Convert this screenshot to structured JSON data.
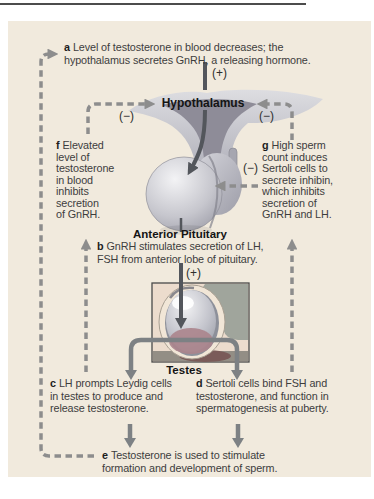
{
  "figure": {
    "title_labels": {
      "hypothalamus": "Hypothalamus",
      "anterior_pituitary": "Anterior Pituitary",
      "testes": "Testes"
    },
    "signs": {
      "plus": "(+)",
      "minus": "(−)"
    },
    "notes": {
      "a": {
        "letter": "a",
        "lines": [
          "Level of testosterone in blood decreases; the",
          "hypothalamus secretes GnRH, a releasing hormone."
        ]
      },
      "b": {
        "letter": "b",
        "lines": [
          "GnRH stimulates secretion of LH,",
          "FSH from anterior lobe of pituitary."
        ]
      },
      "c": {
        "letter": "c",
        "lines": [
          "LH prompts Leydig cells",
          "in testes to produce and",
          "release testosterone."
        ]
      },
      "d": {
        "letter": "d",
        "lines": [
          "Sertoli cells bind FSH and",
          "testosterone, and function in",
          "spermatogenesis at puberty."
        ]
      },
      "e": {
        "letter": "e",
        "lines": [
          "Testosterone is used to stimulate",
          "formation and development of sperm."
        ]
      },
      "f": {
        "letter": "f",
        "lines": [
          "Elevated",
          "level of",
          "testosterone",
          "in blood",
          "inhibits",
          "secretion",
          "of GnRH."
        ]
      },
      "g": {
        "letter": "g",
        "lines": [
          "High sperm",
          "count induces",
          "Sertoli cells to",
          "secrete inhibin,",
          "which inhibits",
          "secretion of",
          "GnRH and LH."
        ]
      }
    },
    "colors": {
      "panel_bg": "#f1eadd",
      "dashed_line": "#8d8d8d",
      "solid_line": "#7d8184",
      "stimulus_arrow": "#53565c",
      "text": "#3d3d3d"
    }
  }
}
